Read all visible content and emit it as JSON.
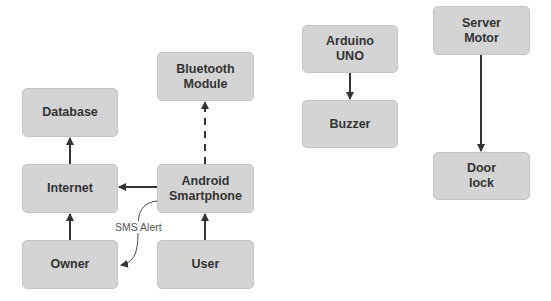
{
  "diagram": {
    "nodes": [
      {
        "id": "database",
        "label": "Database",
        "x": 22,
        "y": 88,
        "w": 96,
        "h": 49
      },
      {
        "id": "bluetooth",
        "label": "Bluetooth\nModule",
        "x": 157,
        "y": 52,
        "w": 97,
        "h": 49
      },
      {
        "id": "internet",
        "label": "Internet",
        "x": 22,
        "y": 164,
        "w": 96,
        "h": 49
      },
      {
        "id": "android",
        "label": "Android\nSmartphone",
        "x": 157,
        "y": 164,
        "w": 97,
        "h": 49
      },
      {
        "id": "owner",
        "label": "Owner",
        "x": 22,
        "y": 240,
        "w": 96,
        "h": 49
      },
      {
        "id": "user",
        "label": "User",
        "x": 157,
        "y": 240,
        "w": 97,
        "h": 49
      },
      {
        "id": "arduino",
        "label": "Arduino\nUNO",
        "x": 302,
        "y": 25,
        "w": 96,
        "h": 48
      },
      {
        "id": "buzzer",
        "label": "Buzzer",
        "x": 302,
        "y": 100,
        "w": 96,
        "h": 48
      },
      {
        "id": "server_motor",
        "label": "Server\nMotor",
        "x": 433,
        "y": 6,
        "w": 97,
        "h": 49
      },
      {
        "id": "door_lock",
        "label": "Door\nlock",
        "x": 433,
        "y": 152,
        "w": 97,
        "h": 48
      }
    ],
    "edges": [
      {
        "from": "internet",
        "to": "database",
        "style": "solid"
      },
      {
        "from": "owner",
        "to": "internet",
        "style": "solid"
      },
      {
        "from": "android",
        "to": "internet",
        "style": "solid"
      },
      {
        "from": "android",
        "to": "bluetooth",
        "style": "dashed"
      },
      {
        "from": "user",
        "to": "android",
        "style": "solid"
      },
      {
        "from": "android",
        "to": "owner",
        "style": "curved",
        "label": "SMS Alert"
      },
      {
        "from": "arduino",
        "to": "buzzer",
        "style": "solid"
      },
      {
        "from": "server_motor",
        "to": "door_lock",
        "style": "solid"
      }
    ],
    "colors": {
      "node_fill": "#d4d4d4",
      "node_text": "#333333",
      "edge": "#333333",
      "label_text": "#555555"
    }
  }
}
